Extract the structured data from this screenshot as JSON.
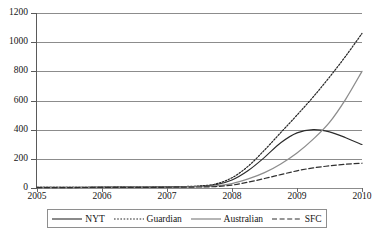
{
  "chart_data": {
    "type": "line",
    "title": "",
    "xlabel": "",
    "ylabel": "",
    "xlim": [
      2005,
      2010
    ],
    "ylim": [
      0,
      1200
    ],
    "grid": true,
    "legend_position": "bottom",
    "y_ticks": [
      0,
      200,
      400,
      600,
      800,
      1000,
      1200
    ],
    "y_tick_labels": [
      "0",
      "200",
      "400",
      "600",
      "800",
      "1000",
      "1200"
    ],
    "x_ticks": [
      2005,
      2006,
      2007,
      2008,
      2009,
      2010
    ],
    "x_tick_labels": [
      "2005",
      "2006",
      "2007",
      "2008",
      "2009",
      "2010"
    ],
    "x": [
      2005,
      2005.5,
      2006,
      2006.5,
      2007,
      2007.25,
      2007.5,
      2007.75,
      2008,
      2008.25,
      2008.5,
      2008.75,
      2009,
      2009.25,
      2009.5,
      2009.75,
      2010
    ],
    "series": [
      {
        "name": "NYT",
        "style": "solid",
        "color": "#2b2b2b",
        "width": 1.1,
        "values": [
          5,
          5,
          6,
          7,
          8,
          9,
          12,
          22,
          55,
          120,
          210,
          310,
          378,
          400,
          385,
          345,
          298
        ]
      },
      {
        "name": "Guardian",
        "style": "dotted",
        "color": "#262626",
        "width": 1.2,
        "values": [
          4,
          4,
          5,
          6,
          8,
          10,
          14,
          28,
          70,
          150,
          260,
          380,
          500,
          625,
          760,
          905,
          1060
        ]
      },
      {
        "name": "Australian",
        "style": "solid",
        "color": "#8d8d8d",
        "width": 1.3,
        "values": [
          3,
          3,
          4,
          5,
          6,
          7,
          9,
          14,
          30,
          62,
          105,
          165,
          240,
          335,
          450,
          610,
          800
        ]
      },
      {
        "name": "SFC",
        "style": "dashed",
        "color": "#2f2f2f",
        "width": 1.2,
        "values": [
          3,
          3,
          4,
          4,
          5,
          6,
          7,
          10,
          20,
          40,
          65,
          92,
          118,
          138,
          152,
          163,
          170
        ]
      }
    ]
  },
  "legend": {
    "items": [
      {
        "label": "NYT"
      },
      {
        "label": "Guardian"
      },
      {
        "label": "Australian"
      },
      {
        "label": "SFC"
      }
    ]
  }
}
